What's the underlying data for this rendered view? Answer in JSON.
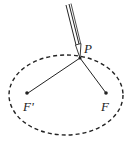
{
  "diagram": {
    "labels": {
      "point": "P",
      "focus_left": "F'",
      "focus_right": "F"
    },
    "colors": {
      "stroke": "#222222",
      "background": "#ffffff"
    },
    "ellipse": {
      "cx": 66,
      "cy": 95,
      "rx": 57,
      "ry": 40,
      "style": "dashed"
    },
    "points": {
      "P": [
        80,
        58
      ],
      "F_prime": [
        27,
        93
      ],
      "F": [
        106,
        93
      ]
    }
  }
}
